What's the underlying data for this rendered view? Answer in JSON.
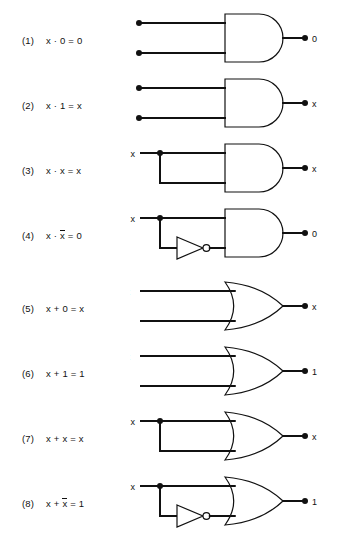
{
  "figure": {
    "row_count": 8,
    "ink_color": "#111111",
    "background_color": "#ffffff"
  },
  "rows": [
    {
      "index": "(1)",
      "equation": "x · 0 = 0",
      "gate": "AND",
      "input_style": "separate",
      "inverted_branch": false,
      "input_dots": true,
      "inputs": [
        {
          "label": "x"
        },
        {
          "label": "0"
        }
      ],
      "output": {
        "label": "0"
      }
    },
    {
      "index": "(2)",
      "equation": "x · 1 = x",
      "gate": "AND",
      "input_style": "separate",
      "inverted_branch": false,
      "input_dots": true,
      "inputs": [
        {
          "label": "x"
        },
        {
          "label": "1"
        }
      ],
      "output": {
        "label": "x"
      }
    },
    {
      "index": "(3)",
      "equation": "x · x = x",
      "gate": "AND",
      "input_style": "fanout",
      "inverted_branch": false,
      "input_dots": false,
      "inputs": [
        {
          "label": "x"
        }
      ],
      "output": {
        "label": "x"
      }
    },
    {
      "index": "(4)",
      "equation_pre": "x · ",
      "equation_bar": "x",
      "equation_post": " = 0",
      "equation": "x · x̄ = 0",
      "gate": "AND",
      "input_style": "fanout",
      "inverted_branch": true,
      "input_dots": false,
      "inputs": [
        {
          "label": "x"
        }
      ],
      "output": {
        "label": "0"
      }
    },
    {
      "index": "(5)",
      "equation": "x + 0 = x",
      "gate": "OR",
      "input_style": "separate",
      "inverted_branch": false,
      "input_dots": false,
      "inputs": [
        {
          "label": "x"
        },
        {
          "label": "0"
        }
      ],
      "output": {
        "label": "x"
      }
    },
    {
      "index": "(6)",
      "equation": "x + 1 = 1",
      "gate": "OR",
      "input_style": "separate",
      "inverted_branch": false,
      "input_dots": false,
      "inputs": [
        {
          "label": "x"
        },
        {
          "label": "1"
        }
      ],
      "output": {
        "label": "1"
      }
    },
    {
      "index": "(7)",
      "equation": "x + x = x",
      "gate": "OR",
      "input_style": "fanout",
      "inverted_branch": false,
      "input_dots": false,
      "inputs": [
        {
          "label": "x"
        }
      ],
      "output": {
        "label": "x"
      }
    },
    {
      "index": "(8)",
      "equation_pre": "x + ",
      "equation_bar": "x",
      "equation_post": " = 1",
      "equation": "x + x̄ = 1",
      "gate": "OR",
      "input_style": "fanout",
      "inverted_branch": true,
      "input_dots": false,
      "inputs": [
        {
          "label": "x"
        }
      ],
      "output": {
        "label": "1"
      }
    }
  ]
}
